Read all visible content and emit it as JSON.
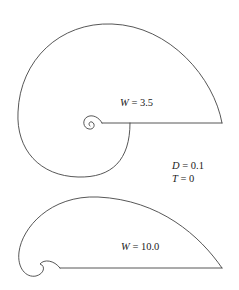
{
  "figure": {
    "shells": [
      {
        "id": "shell-w35",
        "parameter": "W",
        "value": "3.5",
        "label": "W = 3.5"
      },
      {
        "id": "shell-w10",
        "parameter": "W",
        "value": "10.0",
        "label": "W = 10.0"
      }
    ],
    "shared_parameters": [
      {
        "parameter": "D",
        "value": "0.1",
        "label": "D = 0.1"
      },
      {
        "parameter": "T",
        "value": "0",
        "label": "T = 0"
      }
    ],
    "colors": {
      "stroke": "#444444",
      "text": "#222222",
      "background": "#ffffff"
    }
  },
  "labels": {
    "w1_var": "W",
    "w1_eq": " = 3.5",
    "w2_var": "W",
    "w2_eq": " = 10.0",
    "d_var": "D",
    "d_eq": " = 0.1",
    "t_var": "T",
    "t_eq": " = 0"
  }
}
